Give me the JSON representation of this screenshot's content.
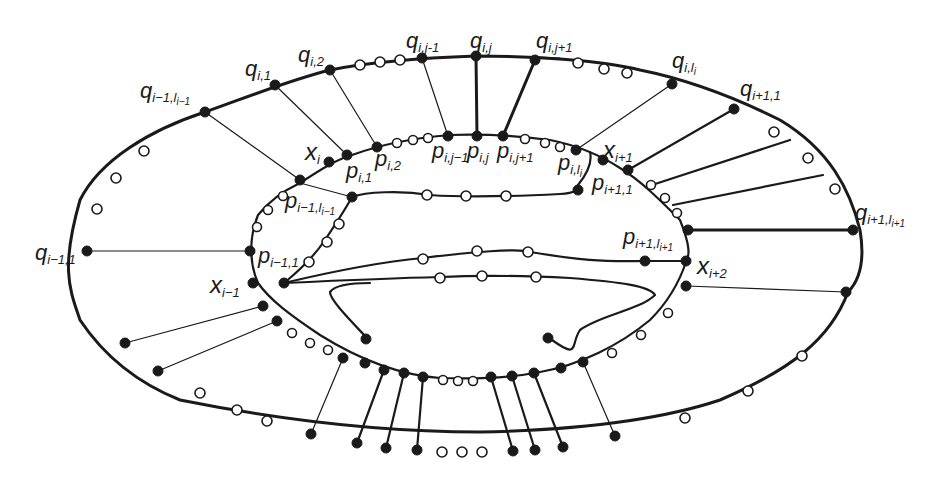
{
  "diagram": {
    "colors": {
      "stroke": "#1a1a1a",
      "filled_node": "#1a1a1a",
      "hollow_node": "#ffffff",
      "background": "#ffffff"
    },
    "labels": {
      "q_im1_lim1": {
        "base": "q",
        "sub": "i−1,l",
        "subsub": "i−1"
      },
      "q_i1": {
        "base": "q",
        "sub": "i,1"
      },
      "q_i2": {
        "base": "q",
        "sub": "i,2"
      },
      "q_ijm1": {
        "base": "q",
        "sub": "i,j-1"
      },
      "q_ij": {
        "base": "q",
        "sub": "i,j"
      },
      "q_ijp1": {
        "base": "q",
        "sub": "i,j+1"
      },
      "q_ili": {
        "base": "q",
        "sub": "i,l",
        "subsub": "i"
      },
      "q_ip1_1": {
        "base": "q",
        "sub": "i+1,1"
      },
      "q_ip1_lip1": {
        "base": "q",
        "sub": "i+1,l",
        "subsub": "i+1"
      },
      "q_im1_1": {
        "base": "q",
        "sub": "i−1,1"
      },
      "x_i": {
        "base": "x",
        "sub": "i"
      },
      "x_ip1": {
        "base": "x",
        "sub": "i+1"
      },
      "x_ip2": {
        "base": "x",
        "sub": "i+2"
      },
      "x_im1": {
        "base": "x",
        "sub": "i−1"
      },
      "p_i1": {
        "base": "p",
        "sub": "i,1"
      },
      "p_i2": {
        "base": "p",
        "sub": "i,2"
      },
      "p_ijm1": {
        "base": "p",
        "sub": "i,j−1"
      },
      "p_ij": {
        "base": "p",
        "sub": "i,j"
      },
      "p_ijp1": {
        "base": "p",
        "sub": "i,j+1"
      },
      "p_ili": {
        "base": "p",
        "sub": "i,l",
        "subsub": "i"
      },
      "p_ip1_1": {
        "base": "p",
        "sub": "i+1,1"
      },
      "p_ip1_lip1": {
        "base": "p",
        "sub": "i+1,l",
        "subsub": "i+1"
      },
      "p_im1_lim1": {
        "base": "p",
        "sub": "i−1,l",
        "subsub": "i−1"
      },
      "p_im1_1": {
        "base": "p",
        "sub": "i−1,1"
      }
    },
    "node_legend": {
      "filled": "labeled/marked vertex",
      "hollow": "intermediate vertex"
    }
  }
}
